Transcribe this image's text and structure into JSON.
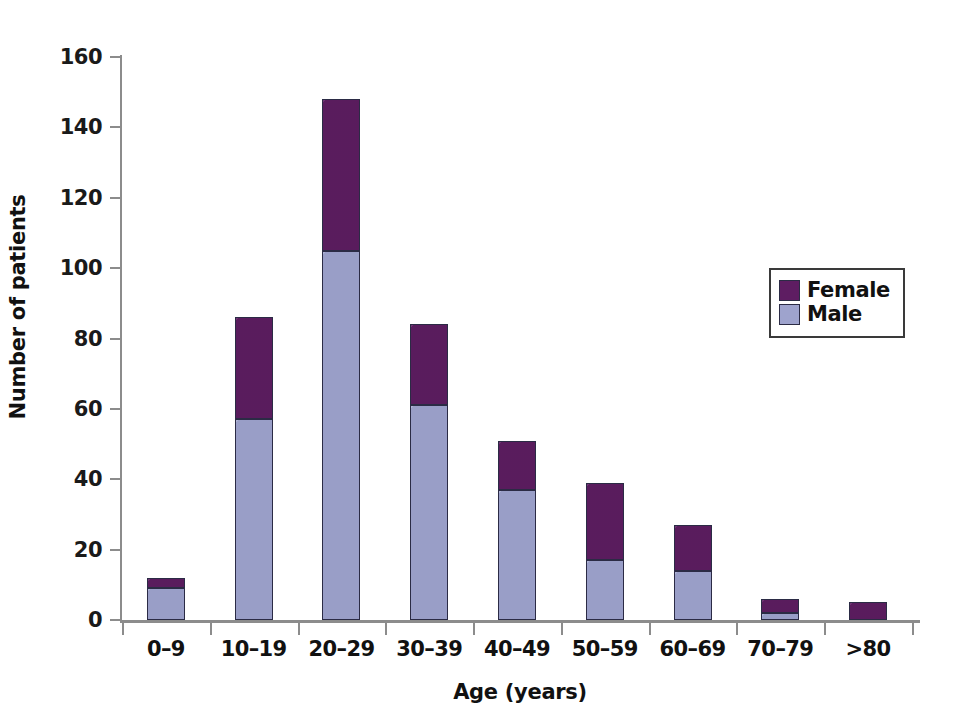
{
  "chart_data": {
    "type": "bar",
    "stacked": true,
    "title": "",
    "xlabel": "Age (years)",
    "ylabel": "Number of patients",
    "categories": [
      "0–9",
      "10–19",
      "20–29",
      "30–39",
      "40–49",
      "50–59",
      "60–69",
      "70–79",
      ">80"
    ],
    "series": [
      {
        "name": "Male",
        "color": "#9ea3cd",
        "values": [
          9,
          57,
          105,
          61,
          37,
          17,
          14,
          2,
          0
        ]
      },
      {
        "name": "Female",
        "color": "#5e1d62",
        "values": [
          3,
          29,
          43,
          23,
          14,
          22,
          13,
          4,
          5
        ]
      }
    ],
    "totals": [
      12,
      86,
      148,
      84,
      51,
      39,
      27,
      6,
      5
    ],
    "ylim": [
      0,
      160
    ],
    "yticks": [
      0,
      20,
      40,
      60,
      80,
      100,
      120,
      140,
      160
    ],
    "ytick_labels": [
      "0",
      "20",
      "40",
      "60",
      "80",
      "100",
      "120",
      "140",
      "160"
    ],
    "grid": false,
    "legend_position": "upper right",
    "legend_entries": [
      "Female",
      "Male"
    ]
  },
  "axes": {
    "y_title": "Number of patients",
    "x_title": "Age (years)"
  },
  "legend": {
    "female_label": "Female",
    "male_label": "Male"
  }
}
